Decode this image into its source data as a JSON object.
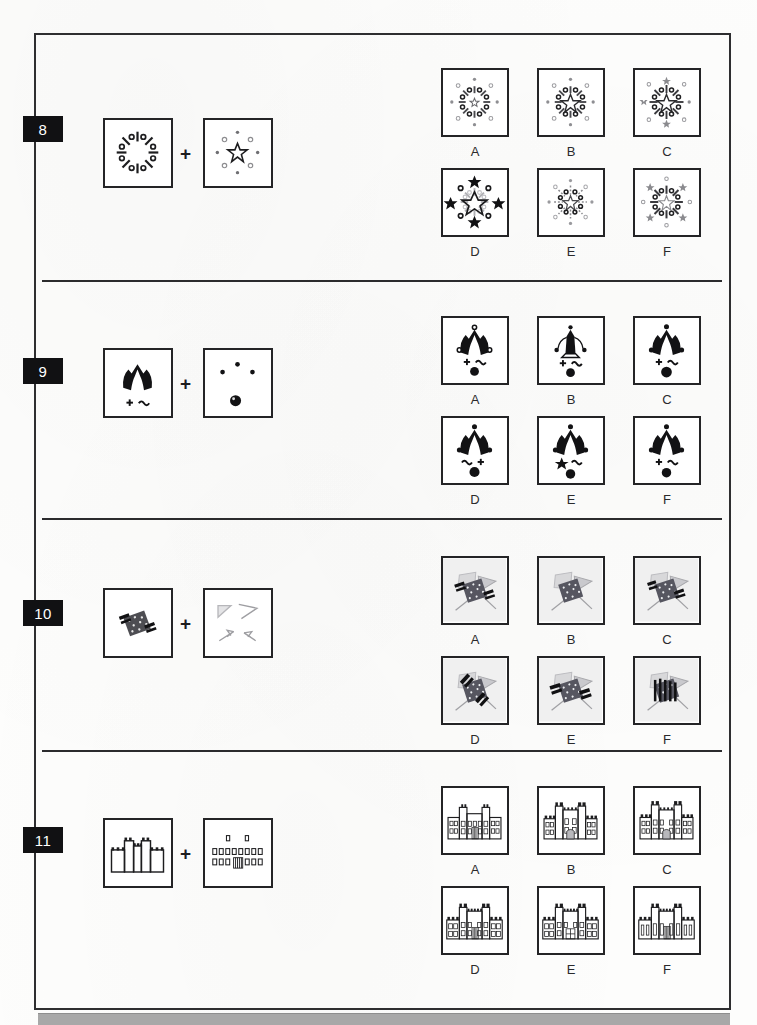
{
  "page": {
    "type": "visual-reasoning-test-page",
    "bottom_bar_color": "#a8a8a8",
    "border_color": "#2e2e30"
  },
  "questions": [
    {
      "number": "8",
      "theme": "starburst-percent-symbols",
      "stimulus": [
        {
          "name": "percent-radial-figure",
          "desc": "eight percent signs radiating from centre"
        },
        {
          "name": "star-and-dots-figure",
          "desc": "open star centre with ring of circles and small stars"
        }
      ],
      "options": [
        {
          "label": "A",
          "variant": "small-centre-star-light-spokes"
        },
        {
          "label": "B",
          "variant": "large-centre-star-light-spokes"
        },
        {
          "label": "C",
          "variant": "large-centre-star-grey-outer-stars"
        },
        {
          "label": "D",
          "variant": "bold-black-stars-large-centre"
        },
        {
          "label": "E",
          "variant": "dotted-spokes-compact"
        },
        {
          "label": "F",
          "variant": "light-centre-star-grey-outer"
        }
      ]
    },
    {
      "number": "9",
      "theme": "jester-figure-with-dots",
      "stimulus": [
        {
          "name": "jester-figure",
          "desc": "black jester silhouette above plus and tilde marks"
        },
        {
          "name": "dots-figure",
          "desc": "three small dots and one large dot"
        }
      ],
      "options": [
        {
          "label": "A",
          "variant": "open-circle-tips-plus-tilde"
        },
        {
          "label": "B",
          "variant": "outlined-body-curved-arms"
        },
        {
          "label": "C",
          "variant": "solid-tips-plus-tilde-large-dot"
        },
        {
          "label": "D",
          "variant": "tilde-plus-reversed"
        },
        {
          "label": "E",
          "variant": "star-instead-of-plus"
        },
        {
          "label": "F",
          "variant": "plus-tilde-standard"
        }
      ]
    },
    {
      "number": "10",
      "theme": "crossed-flags-and-banners",
      "stimulus": [
        {
          "name": "dark-banner-cluster",
          "desc": "dark speckled diamond banner cluster"
        },
        {
          "name": "grey-flag-outlines",
          "desc": "four faint grey triangular flag outlines"
        }
      ],
      "options": [
        {
          "label": "A",
          "variant": "striped-band-left-and-right"
        },
        {
          "label": "B",
          "variant": "plain-diamond-no-bands"
        },
        {
          "label": "C",
          "variant": "bands-top-and-bottom"
        },
        {
          "label": "D",
          "variant": "diagonal-stripe-bands"
        },
        {
          "label": "E",
          "variant": "single-left-band"
        },
        {
          "label": "F",
          "variant": "vertical-stripes-overlay"
        }
      ]
    },
    {
      "number": "11",
      "theme": "castle-facade",
      "stimulus": [
        {
          "name": "castle-outline",
          "desc": "crenellated castle wall with two towers"
        },
        {
          "name": "windows-and-doorway",
          "desc": "rows of small windows and a striped doorway"
        }
      ],
      "options": [
        {
          "label": "A",
          "variant": "low-flat-roofline"
        },
        {
          "label": "B",
          "variant": "tall-central-block-plain-door"
        },
        {
          "label": "C",
          "variant": "tall-towers-arched-door"
        },
        {
          "label": "D",
          "variant": "wide-crenellation-striped-door"
        },
        {
          "label": "E",
          "variant": "grid-door-centre"
        },
        {
          "label": "F",
          "variant": "narrow-windows-striped-door"
        }
      ]
    }
  ]
}
